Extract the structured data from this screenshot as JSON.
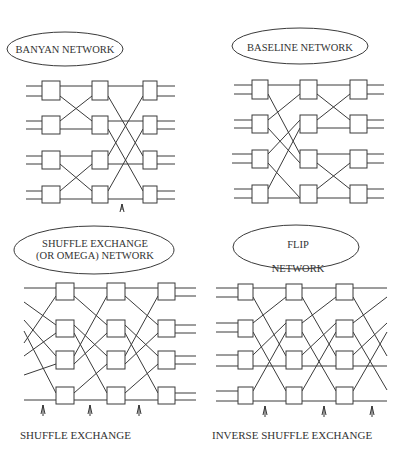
{
  "figure": {
    "panels": [
      {
        "id": "banyan",
        "title_lines": [
          "BANYAN NETWORK"
        ],
        "caption": "",
        "stages": 3,
        "switches_per_stage": 4
      },
      {
        "id": "baseline",
        "title_lines": [
          "BASELINE NETWORK"
        ],
        "caption": "",
        "stages": 3,
        "switches_per_stage": 4
      },
      {
        "id": "omega",
        "title_lines": [
          "SHUFFLE EXCHANGE",
          "(OR OMEGA) NETWORK"
        ],
        "caption": "SHUFFLE EXCHANGE",
        "stages": 3,
        "switches_per_stage": 4
      },
      {
        "id": "flip",
        "title_lines": [
          "FLIP",
          "NETWORK"
        ],
        "caption": "INVERSE SHUFFLE EXCHANGE",
        "stages": 3,
        "switches_per_stage": 4
      }
    ],
    "colors": {
      "line": "#3a3a3a",
      "text": "#333333",
      "background": "#ffffff"
    }
  }
}
